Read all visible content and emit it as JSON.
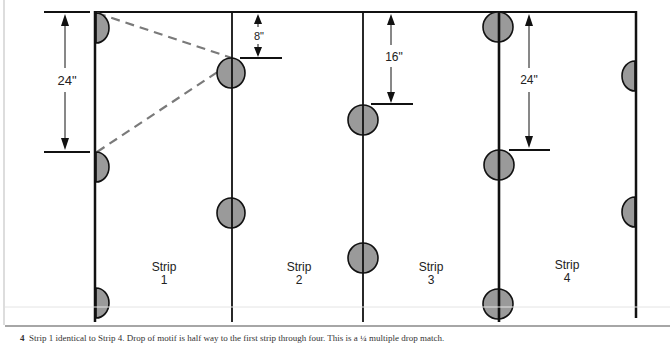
{
  "diagram": {
    "colors": {
      "line": "#111111",
      "dot_fill": "#9a9a9a",
      "dashed": "#7a7a7a",
      "caption_rule": "#888888"
    },
    "strips": [
      {
        "label": "Strip",
        "number": "1"
      },
      {
        "label": "Strip",
        "number": "2"
      },
      {
        "label": "Strip",
        "number": "3"
      },
      {
        "label": "Strip",
        "number": "4"
      }
    ],
    "dimensions": [
      {
        "label": "24\"",
        "strip": 1
      },
      {
        "label": "8\"",
        "strip": 2
      },
      {
        "label": "16\"",
        "strip": 3
      },
      {
        "label": "24\"",
        "strip": 4
      }
    ]
  },
  "caption": {
    "marker": "4",
    "text": "Strip 1 identical to Strip 4. Drop of motif is half way to the first strip through four. This is a ¼ multiple drop match."
  }
}
